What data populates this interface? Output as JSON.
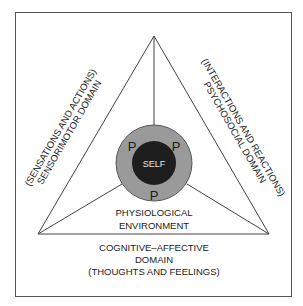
{
  "diagram": {
    "center_label": "SELF",
    "ring_labels": [
      "P",
      "P",
      "P"
    ],
    "left_side": {
      "line1": "(SENSATIONS AND ACTIONS)",
      "line2": "SENSORIMOTOR DOMAIN"
    },
    "right_side": {
      "line1": "(INTERACTIONS AND REACTIONS)",
      "line2": "PSYCHOSOCIAL DOMAIN"
    },
    "inner_bottom": {
      "line1": "PHYSIOLOGICAL",
      "line2": "ENVIRONMENT"
    },
    "bottom": {
      "line1": "COGNITIVE–AFFECTIVE",
      "line2": "DOMAIN",
      "line3": "(THOUGHTS AND FEELINGS)"
    },
    "colors": {
      "outer_ring": "#9a9a9a",
      "inner_core": "#1e1e1e",
      "lines": "#444444",
      "border": "#555555"
    }
  }
}
